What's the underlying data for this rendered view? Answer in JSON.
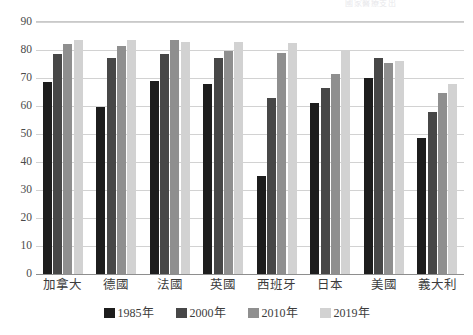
{
  "chart_data": {
    "type": "bar",
    "title": "",
    "subtitle": "",
    "xlabel": "",
    "ylabel": "",
    "ylim": [
      0,
      90
    ],
    "ytick_step": 10,
    "yticks": [
      "90",
      "80",
      "70",
      "60",
      "50",
      "40",
      "30",
      "20",
      "10",
      "0"
    ],
    "grid": true,
    "legend_position": "bottom-center",
    "categories": [
      "加拿大",
      "德國",
      "法國",
      "英國",
      "西班牙",
      "日本",
      "美國",
      "義大利"
    ],
    "series": [
      {
        "name": "1985年",
        "color": "#1d1d1d",
        "values": [
          68.5,
          59.5,
          69.0,
          68.0,
          35.0,
          61.0,
          70.0,
          48.5
        ]
      },
      {
        "name": "2000年",
        "color": "#474747",
        "values": [
          78.5,
          77.0,
          78.5,
          77.0,
          63.0,
          66.5,
          77.0,
          58.0
        ]
      },
      {
        "name": "2010年",
        "color": "#8f8f8f",
        "values": [
          82.0,
          81.5,
          83.5,
          79.5,
          79.0,
          71.5,
          75.5,
          64.5
        ]
      },
      {
        "name": "2019年",
        "color": "#d2d2d2",
        "values": [
          83.5,
          83.5,
          83.0,
          83.0,
          82.5,
          80.0,
          76.0,
          68.0
        ]
      }
    ]
  },
  "legend": {
    "items": [
      {
        "label": "1985年",
        "color": "#1d1d1d"
      },
      {
        "label": "2000年",
        "color": "#474747"
      },
      {
        "label": "2010年",
        "color": "#8f8f8f"
      },
      {
        "label": "2019年",
        "color": "#d2d2d2"
      }
    ]
  },
  "top_cropped_text": "國家醫療支出",
  "colors": {
    "gridline": "#d2d2d2",
    "axis": "#8e8e8e",
    "text": "#3c3c3c",
    "background": "#ffffff"
  }
}
